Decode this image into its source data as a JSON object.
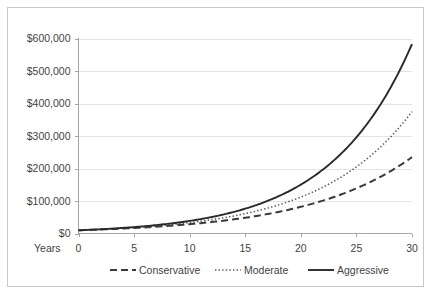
{
  "chart_data": {
    "type": "line",
    "title": "",
    "subtitle": "",
    "xlabel": "Years",
    "ylabel": "",
    "xlim": [
      0,
      30
    ],
    "ylim": [
      0,
      600000
    ],
    "grid": true,
    "grid_axis": "y",
    "legend_position": "bottom",
    "x_tick_labels": [
      "0",
      "5",
      "10",
      "15",
      "20",
      "25",
      "30"
    ],
    "x_ticks": [
      0,
      5,
      10,
      15,
      20,
      25,
      30
    ],
    "y_tick_labels": [
      "$0",
      "$100,000",
      "$200,000",
      "$300,000",
      "$400,000",
      "$500,000",
      "$600,000"
    ],
    "y_ticks": [
      0,
      100000,
      200000,
      300000,
      400000,
      500000,
      600000
    ],
    "x": [
      0,
      1,
      2,
      3,
      4,
      5,
      6,
      7,
      8,
      9,
      10,
      11,
      12,
      13,
      14,
      15,
      16,
      17,
      18,
      19,
      20,
      21,
      22,
      23,
      24,
      25,
      26,
      27,
      28,
      29,
      30
    ],
    "series": [
      {
        "name": "Conservative",
        "style": "dashed",
        "color": "#3a3a3a",
        "values": [
          10000,
          11200,
          12500,
          14000,
          15600,
          17400,
          19300,
          21400,
          23800,
          26400,
          29200,
          32300,
          35800,
          39600,
          43800,
          48400,
          53500,
          59100,
          65300,
          72100,
          79600,
          87900,
          97000,
          107000,
          118100,
          130300,
          143700,
          158500,
          174800,
          192800,
          235000
        ]
      },
      {
        "name": "Moderate",
        "style": "dotted",
        "color": "#555555",
        "values": [
          10000,
          11600,
          13400,
          15500,
          17900,
          20700,
          23900,
          27600,
          31800,
          36700,
          42300,
          48700,
          56100,
          64500,
          74200,
          85300,
          98100,
          112700,
          129500,
          148700,
          170800,
          196100,
          225100,
          258300,
          296400,
          340000,
          389900,
          446800,
          512000,
          586000,
          375000
        ]
      },
      {
        "name": "Aggressive",
        "style": "solid",
        "color": "#2a2a2a",
        "values": [
          10000,
          12000,
          14400,
          17300,
          20700,
          24900,
          29900,
          35800,
          43000,
          51600,
          61900,
          74300,
          89200,
          107000,
          128400,
          154100,
          184900,
          221900,
          266300,
          319500,
          383400,
          460100,
          552100,
          662500,
          795000,
          954000,
          1144800,
          1373800,
          1648500,
          1978200,
          583000
        ]
      }
    ],
    "series_endpoint_values": {
      "Conservative": 235000,
      "Moderate": 375000,
      "Aggressive": 583000
    },
    "series_start_value": 10000
  },
  "axis": {
    "x_title": "Years"
  },
  "legend": {
    "entries": [
      {
        "label": "Conservative",
        "style": "dashed"
      },
      {
        "label": "Moderate",
        "style": "dotted"
      },
      {
        "label": "Aggressive",
        "style": "solid"
      }
    ]
  },
  "colors": {
    "conservative": "#3a3a3a",
    "moderate": "#555555",
    "aggressive": "#2a2a2a",
    "gridline": "#e4e4e4",
    "axis": "#a6a6a6",
    "text": "#3f3f3f",
    "frame": "#c9c9c9",
    "background": "#ffffff"
  }
}
